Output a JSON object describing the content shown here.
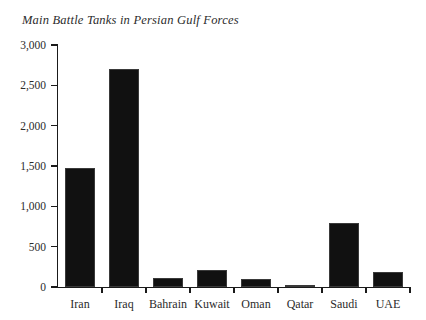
{
  "chart_data": {
    "type": "bar",
    "title": "Main Battle Tanks in Persian Gulf Forces",
    "xlabel": "",
    "ylabel": "",
    "categories": [
      "Iran",
      "Iraq",
      "Bahrain",
      "Kuwait",
      "Oman",
      "Qatar",
      "Saudi",
      "UAE"
    ],
    "values": [
      1470,
      2700,
      110,
      215,
      100,
      25,
      790,
      190
    ],
    "ylim": [
      0,
      3000
    ],
    "yticks": [
      0,
      500,
      1000,
      1500,
      2000,
      2500,
      3000
    ],
    "ytick_labels": [
      "0",
      "500",
      "1,000",
      "1,500",
      "2,000",
      "2,500",
      "3,000"
    ],
    "grid": false,
    "legend": false,
    "bar_color": "#111111",
    "axis_color": "#1a1a1a",
    "text_color": "#2b2b2b",
    "background_color": "#ffffff"
  }
}
